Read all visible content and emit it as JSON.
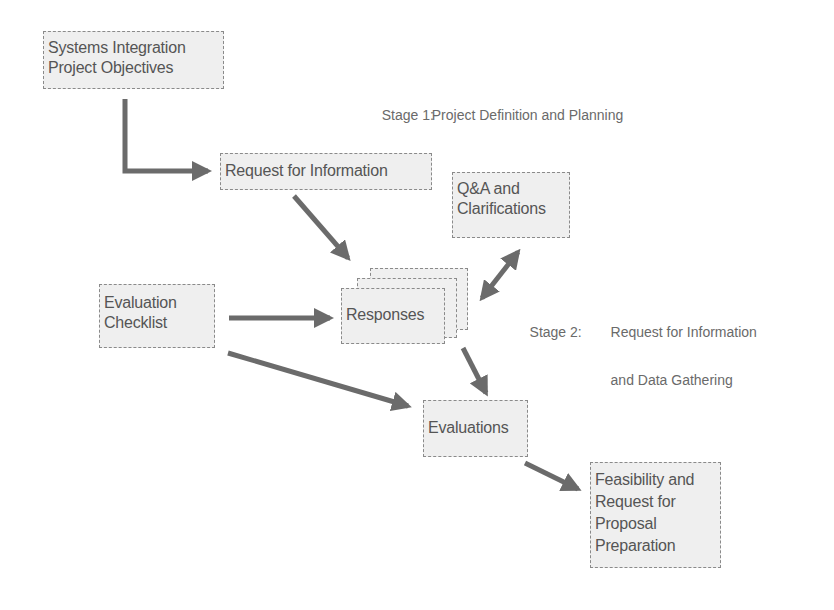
{
  "diagram": {
    "type": "flowchart",
    "stages": [
      {
        "label": "Stage 1:",
        "title_lines": [
          "Project Definition and Planning"
        ]
      },
      {
        "label": "Stage 2:",
        "title_lines": [
          "Request for Information",
          "and Data Gathering"
        ]
      }
    ],
    "nodes": {
      "objectives": {
        "lines": [
          "Systems Integration",
          "Project Objectives"
        ]
      },
      "rfi": {
        "lines": [
          "Request for Information"
        ]
      },
      "qa": {
        "lines": [
          "Q&A and",
          "Clarifications"
        ]
      },
      "checklist": {
        "lines": [
          "Evaluation",
          "Checklist"
        ]
      },
      "responses": {
        "lines": [
          "Responses"
        ]
      },
      "evaluations": {
        "lines": [
          "Evaluations"
        ]
      },
      "feasibility": {
        "lines": [
          "Feasibility and",
          "Request for",
          "Proposal",
          "Preparation"
        ]
      }
    },
    "edges": [
      {
        "from": "Systems Integration Project Objectives",
        "to": "Request for Information"
      },
      {
        "from": "Request for Information",
        "to": "Responses"
      },
      {
        "from": "Responses",
        "to": "Q&A and Clarifications",
        "bidirectional": true
      },
      {
        "from": "Evaluation Checklist",
        "to": "Responses"
      },
      {
        "from": "Evaluation Checklist",
        "to": "Evaluations"
      },
      {
        "from": "Responses",
        "to": "Evaluations"
      },
      {
        "from": "Evaluations",
        "to": "Feasibility and Request for Proposal Preparation"
      }
    ],
    "colors": {
      "box_fill": "#efefef",
      "box_border": "#8a8a8a",
      "text": "#555555",
      "arrow": "#6b6b6b"
    }
  }
}
